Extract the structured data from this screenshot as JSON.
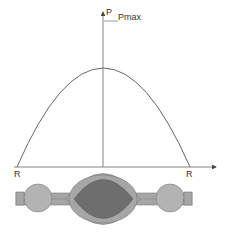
{
  "diagram": {
    "axis": {
      "y_label": "P",
      "peak_label": "Pmax",
      "left_label": "R",
      "right_label": "R"
    },
    "colors": {
      "curve": "#555555",
      "axis": "#666666",
      "outer_body": "#a6a6a6",
      "inner_core": "#6e6e6e",
      "bulbs": "#b3b3b3",
      "stroke": "#7a7a7a"
    }
  }
}
